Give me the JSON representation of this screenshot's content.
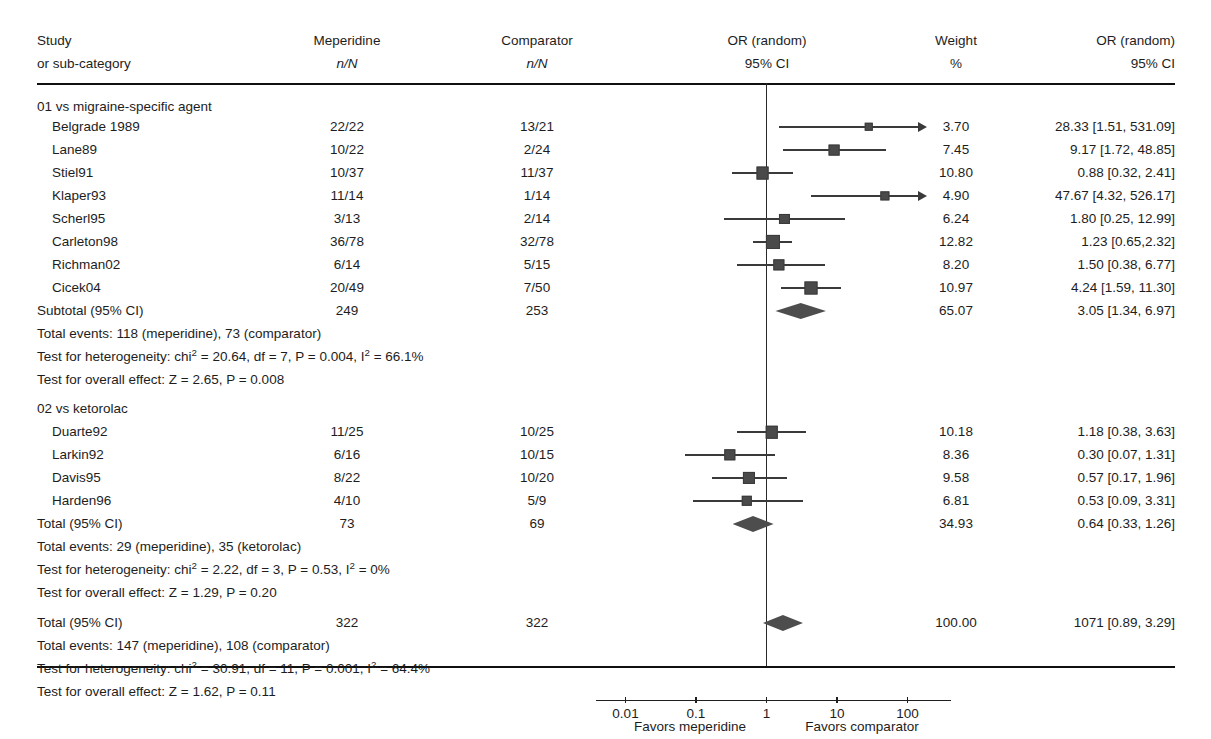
{
  "header": {
    "col_study_line1": "Study",
    "col_study_line2": "or sub-category",
    "col_treat_line1": "Meperidine",
    "col_treat_line2": "n/N",
    "col_comp_line1": "Comparator",
    "col_comp_line2": "n/N",
    "col_plot_line1": "OR (random)",
    "col_plot_line2": "95% CI",
    "col_weight_line1": "Weight",
    "col_weight_line2": "%",
    "col_or_line1": "OR (random)",
    "col_or_line2": "95% CI"
  },
  "axis": {
    "ticks": [
      "0.01",
      "0.1",
      "1",
      "10",
      "100"
    ],
    "tick_values": [
      0.01,
      0.1,
      1,
      10,
      100
    ],
    "favors_left": "Favors meperidine",
    "favors_right": "Favors comparator"
  },
  "groups": [
    {
      "heading": "01 vs migraine-specific agent",
      "studies": [
        {
          "name": "Belgrade 1989",
          "treat": "22/22",
          "comp": "13/21",
          "weight": "3.70",
          "or_text": "28.33 [1.51, 531.09]",
          "or": 28.33,
          "lo": 1.51,
          "hi": 531.09,
          "clipped_hi": true
        },
        {
          "name": "Lane89",
          "treat": "10/22",
          "comp": "2/24",
          "weight": "7.45",
          "or_text": "9.17 [1.72, 48.85]",
          "or": 9.17,
          "lo": 1.72,
          "hi": 48.85,
          "clipped_hi": false
        },
        {
          "name": "Stiel91",
          "treat": "10/37",
          "comp": "11/37",
          "weight": "10.80",
          "or_text": "0.88 [0.32, 2.41]",
          "or": 0.88,
          "lo": 0.32,
          "hi": 2.41,
          "clipped_hi": false
        },
        {
          "name": "Klaper93",
          "treat": "11/14",
          "comp": "1/14",
          "weight": "4.90",
          "or_text": "47.67 [4.32, 526.17]",
          "or": 47.67,
          "lo": 4.32,
          "hi": 526.17,
          "clipped_hi": true
        },
        {
          "name": "Scherl95",
          "treat": "3/13",
          "comp": "2/14",
          "weight": "6.24",
          "or_text": "1.80 [0.25, 12.99]",
          "or": 1.8,
          "lo": 0.25,
          "hi": 12.99,
          "clipped_hi": false
        },
        {
          "name": "Carleton98",
          "treat": "36/78",
          "comp": "32/78",
          "weight": "12.82",
          "or_text": "1.23 [0.65,2.32]",
          "or": 1.23,
          "lo": 0.65,
          "hi": 2.32,
          "clipped_hi": false
        },
        {
          "name": "Richman02",
          "treat": "6/14",
          "comp": "5/15",
          "weight": "8.20",
          "or_text": "1.50 [0.38, 6.77]",
          "or": 1.5,
          "lo": 0.38,
          "hi": 6.77,
          "clipped_hi": false
        },
        {
          "name": "Cicek04",
          "treat": "20/49",
          "comp": "7/50",
          "weight": "10.97",
          "or_text": "4.24 [1.59, 11.30]",
          "or": 4.24,
          "lo": 1.59,
          "hi": 11.3,
          "clipped_hi": false
        }
      ],
      "summary": {
        "label": "Subtotal (95% CI)",
        "treat_total": "249",
        "comp_total": "253",
        "weight": "65.07",
        "or_text": "3.05 [1.34, 6.97]",
        "or": 3.05,
        "lo": 1.34,
        "hi": 6.97
      },
      "total_events": "Total events: 118 (meperidine), 73 (comparator)",
      "heterogeneity_pre": "Test for heterogeneity: chi",
      "heterogeneity_post": " = 20.64, df = 7, P = 0.004, I",
      "heterogeneity_tail": " = 66.1%",
      "overall_effect": "Test for overall effect: Z = 2.65, P = 0.008"
    },
    {
      "heading": "02 vs ketorolac",
      "studies": [
        {
          "name": "Duarte92",
          "treat": "11/25",
          "comp": "10/25",
          "weight": "10.18",
          "or_text": "1.18 [0.38, 3.63]",
          "or": 1.18,
          "lo": 0.38,
          "hi": 3.63,
          "clipped_hi": false
        },
        {
          "name": "Larkin92",
          "treat": "6/16",
          "comp": "10/15",
          "weight": "8.36",
          "or_text": "0.30 [0.07, 1.31]",
          "or": 0.3,
          "lo": 0.07,
          "hi": 1.31,
          "clipped_hi": false
        },
        {
          "name": "Davis95",
          "treat": "8/22",
          "comp": "10/20",
          "weight": "9.58",
          "or_text": "0.57 [0.17, 1.96]",
          "or": 0.57,
          "lo": 0.17,
          "hi": 1.96,
          "clipped_hi": false
        },
        {
          "name": "Harden96",
          "treat": "4/10",
          "comp": "5/9",
          "weight": "6.81",
          "or_text": "0.53 [0.09, 3.31]",
          "or": 0.53,
          "lo": 0.09,
          "hi": 3.31,
          "clipped_hi": false
        }
      ],
      "summary": {
        "label": "Total (95% CI)",
        "treat_total": "73",
        "comp_total": "69",
        "weight": "34.93",
        "or_text": "0.64 [0.33, 1.26]",
        "or": 0.64,
        "lo": 0.33,
        "hi": 1.26
      },
      "total_events": "Total events: 29 (meperidine), 35 (ketorolac)",
      "heterogeneity_pre": "Test for heterogeneity: chi",
      "heterogeneity_post": " = 2.22, df = 3, P = 0.53, I",
      "heterogeneity_tail": " = 0%",
      "overall_effect": "Test for overall effect: Z = 1.29, P = 0.20"
    }
  ],
  "grand_total": {
    "label": "Total (95% CI)",
    "treat_total": "322",
    "comp_total": "322",
    "weight": "100.00",
    "or_text": "1071 [0.89, 3.29]",
    "or": 1.71,
    "lo": 0.89,
    "hi": 3.29,
    "total_events": "Total events: 147 (meperidine), 108 (comparator)",
    "heterogeneity_pre": "Test for heterogeneity: chi",
    "heterogeneity_post": " = 30.91, df = 11, P = 0.001, I",
    "heterogeneity_tail": " = 64.4%",
    "overall_effect": "Test for overall effect: Z = 1.62, P = 0.11"
  },
  "chart_data": {
    "type": "forest",
    "title": "",
    "xlabel": "OR (random) 95% CI",
    "xscale": "log",
    "xlim": [
      0.01,
      100
    ],
    "null_value": 1,
    "effect_measure": "OR (random)",
    "model": "random-effects",
    "categories": [
      "Belgrade 1989",
      "Lane89",
      "Stiel91",
      "Klaper93",
      "Scherl95",
      "Carleton98",
      "Richman02",
      "Cicek04",
      "Subtotal (95% CI)",
      "Duarte92",
      "Larkin92",
      "Davis95",
      "Harden96",
      "Total (95% CI)",
      "Total (95% CI)"
    ],
    "values": [
      28.33,
      9.17,
      0.88,
      47.67,
      1.8,
      1.23,
      1.5,
      4.24,
      3.05,
      1.18,
      0.3,
      0.57,
      0.53,
      0.64,
      1.71
    ],
    "ci_low": [
      1.51,
      1.72,
      0.32,
      4.32,
      0.25,
      0.65,
      0.38,
      1.59,
      1.34,
      0.38,
      0.07,
      0.17,
      0.09,
      0.33,
      0.89
    ],
    "ci_high": [
      531.09,
      48.85,
      2.41,
      526.17,
      12.99,
      2.32,
      6.77,
      11.3,
      6.97,
      3.63,
      1.31,
      1.96,
      3.31,
      1.26,
      3.29
    ],
    "weights": [
      3.7,
      7.45,
      10.8,
      4.9,
      6.24,
      12.82,
      8.2,
      10.97,
      65.07,
      10.18,
      8.36,
      9.58,
      6.81,
      34.93,
      100.0
    ],
    "legend": [
      "Favors meperidine",
      "Favors comparator"
    ],
    "grid": false
  }
}
